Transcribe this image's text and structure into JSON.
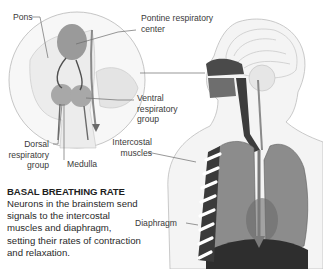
{
  "labels": {
    "pons": "Pons",
    "pontine": [
      "Pontine respiratory",
      "center"
    ],
    "ventral": [
      "Ventral",
      "respiratory",
      "group"
    ],
    "dorsal": [
      "Dorsal",
      "respiratory",
      "group"
    ],
    "medulla": "Medulla",
    "intercostal": [
      "Intercostal",
      "muscles"
    ],
    "diaphragm": "Diaphragm"
  },
  "caption": {
    "title": "BASAL BREATHING RATE",
    "text": "Neurons in the brainstem send signals to the intercostal muscles and diaphragm, setting their rates of contraction and relaxation."
  },
  "colors": {
    "text": "#3a3a3a",
    "illustration": "#8a8a8a",
    "dark": "#3c3c3c",
    "accent_arrow": "#7a7a7a"
  }
}
